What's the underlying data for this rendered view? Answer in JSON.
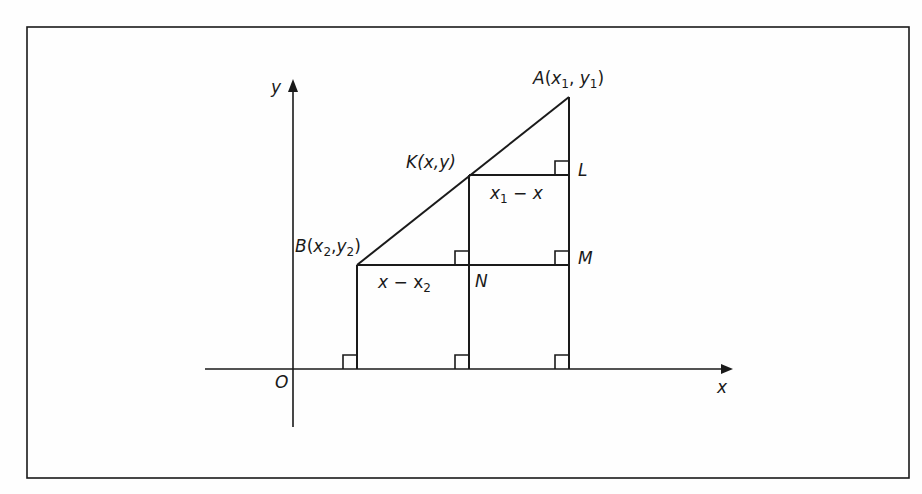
{
  "diagram": {
    "axes": {
      "x_label": "x",
      "y_label": "y",
      "origin_label": "O"
    },
    "points": [
      {
        "id": "A",
        "label": "A",
        "coords": "(x1, y1)",
        "x_sub": "1",
        "y_sub": "1"
      },
      {
        "id": "K",
        "label": "K",
        "coords": "(x,y)"
      },
      {
        "id": "B",
        "label": "B",
        "coords": "(x2,y2)",
        "x_sub": "2",
        "y_sub": "2"
      },
      {
        "id": "L",
        "label": "L"
      },
      {
        "id": "M",
        "label": "M"
      },
      {
        "id": "N",
        "label": "N"
      }
    ],
    "segment_labels": [
      {
        "id": "KL",
        "text": "x1 − x",
        "var": "x",
        "sub": "1",
        "minus": " − ",
        "rhs": "x"
      },
      {
        "id": "BN",
        "text": "x − x2",
        "lhs": "x",
        "minus": " − ",
        "var": "x",
        "sub": "2"
      }
    ],
    "right_angle_markers": [
      "L",
      "M",
      "N-top",
      "foot-B",
      "foot-K",
      "foot-A"
    ],
    "colors": {
      "stroke": "#1a1a1a",
      "background": "#fefefe"
    }
  }
}
